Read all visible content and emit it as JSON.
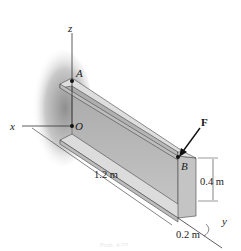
{
  "figure": {
    "axes": {
      "x": "x",
      "y": "y",
      "z": "z"
    },
    "points": {
      "A": "A",
      "O": "O",
      "B": "B"
    },
    "force": {
      "label": "F"
    },
    "dimensions": {
      "length": "1.2 m",
      "height": "0.4 m",
      "width": "0.2 m"
    },
    "caption": "Prob. 4-??",
    "colors": {
      "beam_top": "#d9d9d9",
      "beam_face": "#b5b5b5",
      "beam_edge": "#444444",
      "wall_shadow": "#9a9a9a"
    }
  }
}
